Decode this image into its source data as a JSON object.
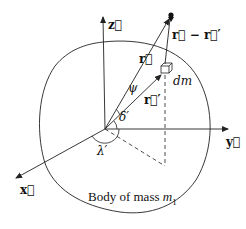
{
  "diagram": {
    "labels": {
      "z_axis": "z⃗",
      "y_axis": "y⃗",
      "x_axis": "x⃗",
      "r": "r⃗",
      "r_prime": "r⃗′",
      "r_minus_r_prime": "r⃗ − r⃗′",
      "dm": "dm",
      "psi": "ψ",
      "delta_prime": "δ′",
      "lambda_prime": "λ′",
      "caption_prefix": "Body of mass ",
      "caption_var": "m",
      "caption_sub": "1"
    },
    "colors": {
      "stroke": "#222222",
      "background": "#ffffff"
    }
  }
}
